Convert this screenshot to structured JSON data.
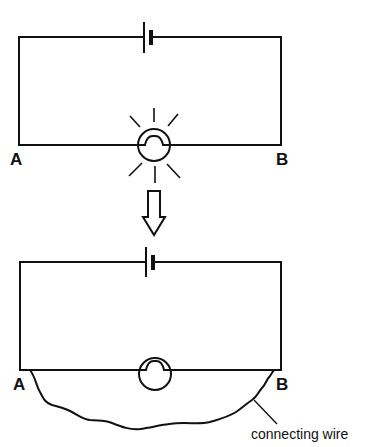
{
  "diagram": {
    "type": "circuit-comparison",
    "colors": {
      "ink": "#111111",
      "background": "#ffffff"
    },
    "top_circuit": {
      "description": "Battery and glowing bulb in series; bulb lit",
      "components": [
        "battery",
        "bulb-lit"
      ],
      "labels": {
        "left_node": "A",
        "right_node": "B"
      }
    },
    "transition": {
      "icon": "down-arrow-icon"
    },
    "bottom_circuit": {
      "description": "Same circuit with connecting wire short-circuiting the bulb between A and B; bulb not lit",
      "components": [
        "battery",
        "bulb-unlit",
        "connecting-wire"
      ],
      "labels": {
        "left_node": "A",
        "right_node": "B",
        "wire_caption": "connecting wire"
      }
    }
  }
}
